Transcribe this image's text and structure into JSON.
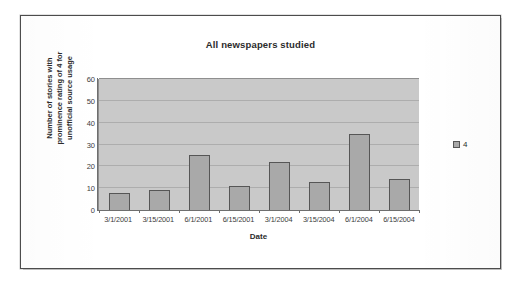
{
  "chart_data": {
    "type": "bar",
    "title": "All newspapers studied",
    "xlabel": "Date",
    "ylabel": "Number of stories with prominence rating of 4 for unofficial source usage",
    "ylabel_lines": [
      "Number of stories with",
      "prominence rating of 4 for",
      "unofficial source usage"
    ],
    "categories": [
      "3/1/2001",
      "3/15/2001",
      "6/1/2001",
      "6/15/2001",
      "3/1/2004",
      "3/15/2004",
      "6/1/2004",
      "6/15/2004"
    ],
    "values": [
      8,
      9,
      25,
      11,
      22,
      13,
      35,
      14
    ],
    "series": [
      {
        "name": "4",
        "values": [
          8,
          9,
          25,
          11,
          22,
          13,
          35,
          14
        ]
      }
    ],
    "ylim": [
      0,
      60
    ],
    "yticks": [
      0,
      10,
      20,
      30,
      40,
      50,
      60
    ],
    "ytick_labels": [
      "0",
      "10",
      "20",
      "30",
      "40",
      "50",
      "60"
    ],
    "grid": true,
    "grid_axis": "y",
    "legend": {
      "position": "right",
      "entries": [
        {
          "label": "4",
          "swatch_name": "legend-swatch-series-4"
        }
      ]
    },
    "colors": {
      "plot_area": "#c9c9c9",
      "bar_fill": "#a9a9a9",
      "bar_border": "#565656",
      "gridline": "#a8a8a8",
      "axis_line": "#6e6e6e",
      "text": "#2b2b2b",
      "page_background": "#ffffff",
      "page_border": "#4c4c4c"
    }
  }
}
